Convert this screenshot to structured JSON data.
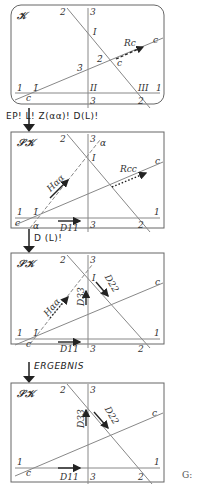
{
  "panels": [
    {
      "title": "𝒦",
      "labels": {
        "line2": "2",
        "line3": "3",
        "point_I": "I",
        "vector": "Rc",
        "line_c_top": "c",
        "point_2bar": "2̄",
        "point_c": "c",
        "point_3bar": "3̄",
        "line1_left": "1",
        "point_1bar": "1̄",
        "point_II": "II",
        "point_III": "III",
        "line1_right": "1",
        "line_c_bottom": "c",
        "line3_bottom": "3",
        "line2_bottom": "2"
      }
    },
    {
      "title": "𝒮𝒦",
      "labels": {
        "line2": "2",
        "line3": "3",
        "alpha_top": "α",
        "point_I": "I",
        "vector_H": "Hαα",
        "vector_R": "Rcc",
        "line_c_top": "c",
        "line1_left": "1",
        "point_1bar": "1̄",
        "line1_right": "1",
        "line_c_bottom": "c",
        "alpha_bottom": "α",
        "vector_D": "D11",
        "line3_bottom": "3",
        "line2_bottom": "2"
      }
    },
    {
      "title": "𝒮𝒦",
      "labels": {
        "line2": "2",
        "line3": "3",
        "point_I": "I",
        "vector_H": "Hαα",
        "vector_D33": "D33",
        "vector_D22": "D22",
        "line_c_top": "c",
        "line1_left": "1",
        "point_1bar": "1̄",
        "line1_right": "1",
        "line_c_bottom": "c",
        "vector_D": "D11",
        "line3_bottom": "3",
        "line2_bottom": "2"
      }
    },
    {
      "title": "𝒮𝒦",
      "labels": {
        "line2": "2",
        "line3": "3",
        "vector_D33": "D33",
        "vector_D22": "D22",
        "line_c_top": "c",
        "line1_left": "1",
        "line1_right": "1",
        "line_c_bottom": "c",
        "vector_D": "D11",
        "line3_bottom": "3",
        "line2_bottom": "2"
      }
    }
  ],
  "steps": [
    {
      "label": "EP! L! Z(αα)! D(L)!"
    },
    {
      "label": "D (L)!"
    },
    {
      "label": "ERGEBNIS"
    }
  ],
  "footer": {
    "label": "G:"
  }
}
